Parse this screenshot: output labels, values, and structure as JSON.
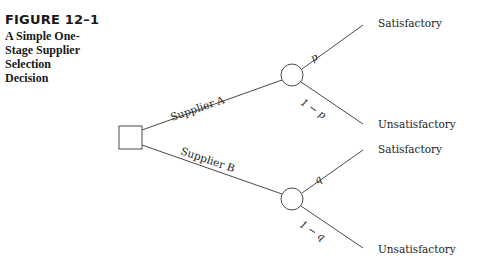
{
  "figure": {
    "number": "FIGURE 12–1",
    "title_lines": [
      "A Simple One-",
      "Stage Supplier",
      "Selection",
      "Decision"
    ]
  },
  "diagram": {
    "type": "decision-tree",
    "decision_node": {
      "shape": "square"
    },
    "branches": [
      {
        "label": "Supplier A",
        "chance_node": {
          "shape": "circle"
        },
        "outcomes": [
          {
            "label": "Satisfactory",
            "probability": "p"
          },
          {
            "label": "Unsatisfactory",
            "probability": "1 − p"
          }
        ]
      },
      {
        "label": "Supplier B",
        "chance_node": {
          "shape": "circle"
        },
        "outcomes": [
          {
            "label": "Satisfactory",
            "probability": "q"
          },
          {
            "label": "Unsatisfactory",
            "probability": "1 − q"
          }
        ]
      }
    ]
  },
  "colors": {
    "line": "#4a4a4a",
    "text": "#222222",
    "background": "#ffffff"
  }
}
